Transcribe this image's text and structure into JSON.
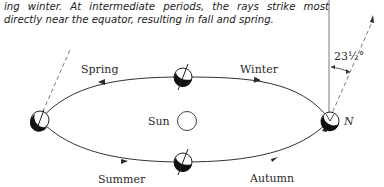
{
  "caption": {
    "line1": "ing winter. At intermediate periods, the rays strike most",
    "line2": "directly near the equator, resulting in fall and spring."
  },
  "diagram": {
    "labels": {
      "spring": "Spring",
      "winter": "Winter",
      "summer": "Summer",
      "autumn": "Autumn",
      "sun": "Sun",
      "north": "N",
      "tilt_angle": "23½°"
    },
    "orbit_direction": "counterclockwise (arrows: top path right-to-left, bottom path left-to-right)",
    "earth_positions": [
      "left (summer solstice side)",
      "top (spring)",
      "bottom (summer/autumn)",
      "right (N, winter solstice side)"
    ],
    "colors": {
      "ink": "#2a2a2a",
      "background": "#ffffff"
    }
  }
}
